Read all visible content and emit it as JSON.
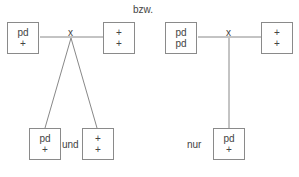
{
  "separator": "bzw.",
  "left_diagram": {
    "node_label": "x",
    "left_box": [
      "pd",
      "+"
    ],
    "right_box": [
      "+",
      "+"
    ],
    "children": [
      {
        "lines": [
          "pd",
          "+"
        ]
      },
      {
        "lines": [
          "+",
          "+"
        ]
      }
    ],
    "conjunction": "und"
  },
  "right_diagram": {
    "node_label": "x",
    "left_box": [
      "pd",
      "pd"
    ],
    "right_box": [
      "+",
      "+"
    ],
    "children": [
      {
        "lines": [
          "pd",
          "+"
        ]
      }
    ],
    "qualifier": "nur"
  }
}
